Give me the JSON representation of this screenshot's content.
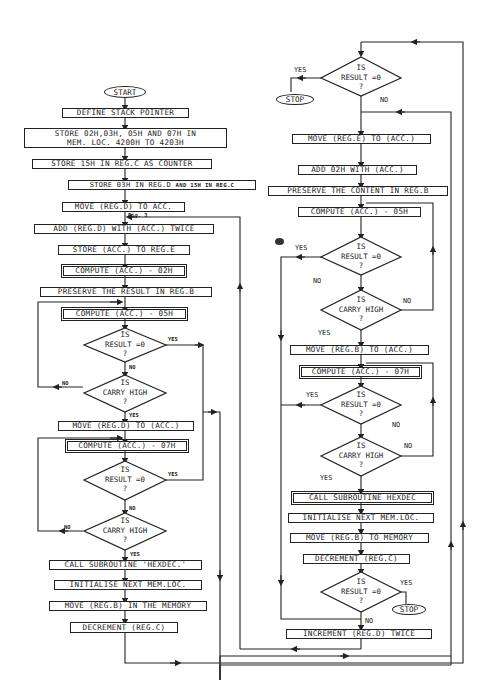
{
  "left_flow": {
    "start": "START",
    "steps": [
      "DEFINE STACK POINTER",
      "STORE  02H,03H, 05H AND  07H  IN",
      "MEM. LOC. 4200H TO 4203H",
      "STORE 15H IN REG.C AS COUNTER",
      "STORE 03H IN REG.D",
      "AND 15H IN REG.C",
      "MOVE (REG.D) TO ACC.",
      "ADD (REG.D) WITH (ACC.) TWICE",
      "STORE (ACC.) TO REG.E",
      "COMPUTE (ACC.) - 02H",
      "PRESERVE THE RESULT IN REG.B",
      "COMPUTE (ACC.) - 05H",
      "MOVE (REG.D) TO (ACC.)",
      "COMPUTE (ACC.) - 07H",
      "CALL SUBROUTINE 'HEXDEC.'",
      "INITIALISE NEXT MEM.LOC.",
      "MOVE (REG.B) IN THE MEMORY",
      "DECREMENT (REG.C)"
    ],
    "decisions": [
      {
        "l1": "IS",
        "l2": "RESULT =0",
        "l3": "?",
        "yes": "YES",
        "no": "NO"
      },
      {
        "l1": "IS",
        "l2": "CARRY HIGH",
        "l3": "?",
        "yes": "YES",
        "no": "NO"
      },
      {
        "l1": "IS",
        "l2": "RESULT =0",
        "l3": "?",
        "yes": "YES",
        "no": "NO"
      },
      {
        "l1": "IS",
        "l2": "CARRY HIGH",
        "l3": "?",
        "yes": "YES",
        "no": "NO"
      }
    ],
    "annotation": "Fig. 3"
  },
  "right_flow": {
    "stop": "STOP",
    "steps": [
      "MOVE (REG.E) TO (ACC.)",
      "ADD 02H WITH (ACC.)",
      "PRESERVE THE CONTENT IN REG.B",
      "COMPUTE (ACC.) - 05H",
      "MOVE (REG.B) TO (ACC.)",
      "COMPUTE (ACC.) - 07H",
      "CALL SUBROUTINE HEXDEC",
      "INITIALISE NEXT MEM.LOC.",
      "MOVE (REG.B) TO MEMORY",
      "DECREMENT (REG.C)",
      "INCREMENT (REG.D) TWICE"
    ],
    "decisions": [
      {
        "l1": "IS",
        "l2": "RESULT =0",
        "l3": "?",
        "yes": "YES",
        "no": "NO"
      },
      {
        "l1": "IS",
        "l2": "RESULT =0",
        "l3": "?",
        "yes": "YES",
        "no": "NO"
      },
      {
        "l1": "IS",
        "l2": "CARRY HIGH",
        "l3": "?",
        "yes": "YES",
        "no": "NO"
      },
      {
        "l1": "IS",
        "l2": "RESULT =0",
        "l3": "?",
        "yes": "YES",
        "no": "NO"
      },
      {
        "l1": "IS",
        "l2": "CARRY HIGH",
        "l3": "?",
        "yes": "YES",
        "no": "NO"
      },
      {
        "l1": "IS",
        "l2": "RESULT =0",
        "l3": "?",
        "yes": "YES",
        "no": "NO"
      }
    ],
    "stop2": "STOP"
  }
}
